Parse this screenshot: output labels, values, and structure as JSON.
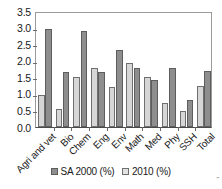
{
  "chart_data": {
    "type": "bar",
    "title": "",
    "subtitle": "",
    "xlabel": "",
    "ylabel": "",
    "categories": [
      "Agri and vet",
      "Bio",
      "Chem",
      "Eng",
      "Env",
      "Math",
      "Med",
      "Phy",
      "SSH",
      "Total"
    ],
    "series": [
      {
        "name": "SA 2000 (%)",
        "color": "#8e8e8e",
        "values": [
          2.95,
          1.66,
          2.9,
          1.66,
          2.33,
          1.79,
          1.43,
          1.77,
          0.82,
          1.68
        ]
      },
      {
        "name": "2010 (%)",
        "color": "#d6d6d6",
        "values": [
          0.97,
          0.55,
          1.52,
          1.79,
          1.21,
          1.93,
          1.51,
          0.73,
          0.47,
          1.24
        ]
      }
    ],
    "draw_order": [
      "2010 (%)",
      "SA 2000 (%)"
    ],
    "ylim": [
      0.0,
      3.5
    ],
    "y_ticks": [
      "0.0",
      "0.5",
      "1.0",
      "1.5",
      "2.0",
      "2.5",
      "3.0",
      "3.5"
    ],
    "y_tick_values": [
      0.0,
      0.5,
      1.0,
      1.5,
      2.0,
      2.5,
      3.0,
      3.5
    ],
    "grid": false,
    "legend_position": "bottom"
  },
  "legend": {
    "entries": [
      {
        "label": "SA 2000 (%)",
        "swatch": "sa2000"
      },
      {
        "label": "2010 (%)",
        "swatch": "2010"
      }
    ]
  },
  "artifact": {
    "mark": "˝"
  }
}
